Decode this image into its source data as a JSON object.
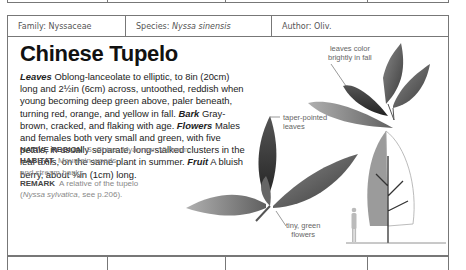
{
  "header": {
    "family_label": "Family:",
    "family_value": "Nyssaceae",
    "species_label": "Species:",
    "species_value": "Nyssa sinensis",
    "author_label": "Author:",
    "author_value": "Oliv."
  },
  "title": "Chinese Tupelo",
  "description": [
    {
      "term": "Leaves",
      "text": " Oblong-lanceolate to elliptic, to 8in (20cm) long and 2½in (6cm) across, untoothed, reddish when young becoming deep green above, paler beneath, turning red, orange, and yellow in fall. "
    },
    {
      "term": "Bark",
      "text": " Gray-brown, cracked, and flaking with age. "
    },
    {
      "term": "Flowers",
      "text": " Males and females both very small and green, with five petals, in usually separate, long-stalked clusters in the leaf axils, on the same plant in summer. "
    },
    {
      "term": "Fruit",
      "text": " A bluish berry, about ⅜in (1cm) long."
    }
  ],
  "facts": {
    "native_region_label": "NATIVE REGION",
    "native_region_value": "S. China, Myanmar, Vietnam.",
    "habitat_label": "HABITAT",
    "habitat_value_1": "Mountain woods",
    "habitat_value_2": "and stream banks.",
    "remark_label": "REMARK",
    "remark_value_1": "A relative of the tupelo",
    "remark_value_2_italic": "Nyssa sylvatica",
    "remark_value_2_rest": ", see p.206)."
  },
  "annotations": {
    "fall_color": [
      "leaves color",
      "brightly in fall"
    ],
    "taper": [
      "taper-pointed",
      "leaves"
    ],
    "flowers": [
      "tiny, green",
      "flowers"
    ]
  },
  "illustrations": {
    "leaf_spray_top": "leaf-spray-fall",
    "leaf_spray_bottom": "leaf-spray-green",
    "tree_silhouette": "tree-silhouette",
    "human_scale": "human-figure-scale"
  }
}
